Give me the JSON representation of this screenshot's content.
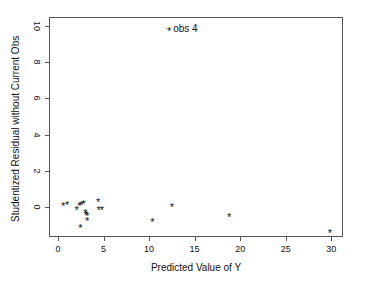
{
  "chart_data": {
    "type": "scatter",
    "title": "",
    "xlabel": "Predicted Value of Y",
    "ylabel": "Studentized Residual without Current Obs",
    "xlim": [
      -1.0,
      31.3
    ],
    "ylim": [
      -1.65,
      10.5
    ],
    "xticks": [
      0,
      5,
      10,
      15,
      20,
      25,
      30
    ],
    "xticklabels": [
      "0",
      "5",
      "10",
      "15",
      "20",
      "25",
      "30"
    ],
    "yticks": [
      0,
      2,
      4,
      6,
      8,
      10
    ],
    "yticklabels": [
      "0",
      "2",
      "4",
      "6",
      "8",
      "10"
    ],
    "grid": false,
    "legend": null,
    "marker": "*",
    "marker_color": "#111111",
    "points": [
      {
        "x": 0.55,
        "y": 0.08
      },
      {
        "x": 1.0,
        "y": 0.1
      },
      {
        "x": 2.05,
        "y": -0.15
      },
      {
        "x": 2.35,
        "y": 0.05
      },
      {
        "x": 2.55,
        "y": 0.12
      },
      {
        "x": 2.8,
        "y": 0.18
      },
      {
        "x": 2.45,
        "y": -1.15
      },
      {
        "x": 3.0,
        "y": -0.35
      },
      {
        "x": 3.05,
        "y": -0.45
      },
      {
        "x": 3.2,
        "y": -0.48
      },
      {
        "x": 3.2,
        "y": -0.75
      },
      {
        "x": 4.4,
        "y": 0.3
      },
      {
        "x": 4.45,
        "y": -0.15
      },
      {
        "x": 4.8,
        "y": -0.15
      },
      {
        "x": 10.35,
        "y": -0.8
      },
      {
        "x": 12.2,
        "y": 9.75
      },
      {
        "x": 12.5,
        "y": 0.0
      },
      {
        "x": 18.8,
        "y": -0.55
      },
      {
        "x": 29.85,
        "y": -1.45
      }
    ],
    "annotations": [
      {
        "text": "obs 4",
        "x": 12.2,
        "y": 9.75
      }
    ]
  }
}
